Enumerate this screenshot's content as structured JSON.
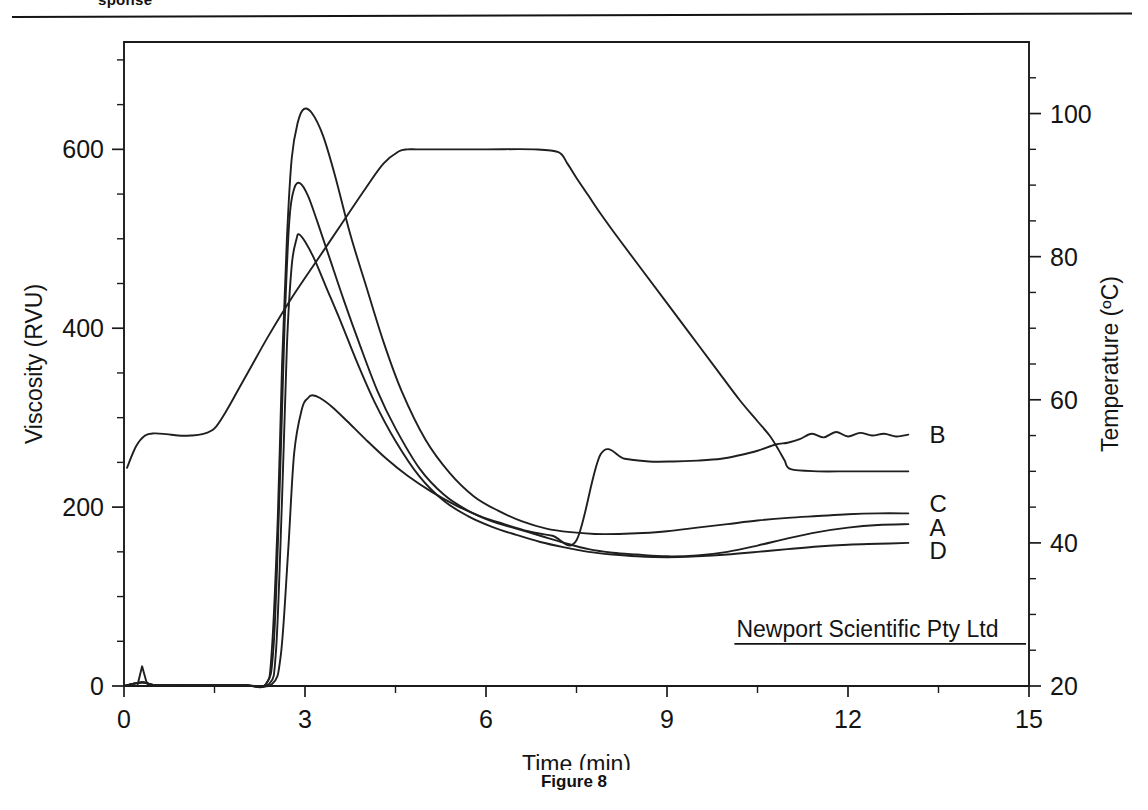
{
  "page": {
    "header_cut_text": "sponse",
    "figure_caption": "Figure 8"
  },
  "watermark": {
    "text": "Newport Scientific Pty Ltd"
  },
  "chart_data": {
    "type": "line",
    "title": "",
    "xlabel": "Time (min)",
    "ylabel": "Viscosity (RVU)",
    "y2label": "Temperature (ºC)",
    "xlim": [
      0,
      15
    ],
    "ylim": [
      0,
      720
    ],
    "y2lim": [
      20,
      110
    ],
    "grid": false,
    "legend_position": "right-inline",
    "xticks": [
      0,
      3,
      6,
      9,
      12,
      15
    ],
    "xticklabels": [
      "0",
      "3",
      "6",
      "9",
      "12",
      "15"
    ],
    "yticks": [
      0,
      200,
      400,
      600
    ],
    "yticklabels": [
      "0",
      "200",
      "400",
      "600"
    ],
    "y2ticks": [
      20,
      40,
      60,
      80,
      100
    ],
    "y2ticklabels": [
      "20",
      "40",
      "60",
      "80",
      "100"
    ],
    "x_minor_step": 1.5,
    "y_minor_step": 50,
    "y2_minor_step": 5,
    "series": [
      {
        "name": "C",
        "label": "C",
        "axis": "left",
        "units": "RVU",
        "peak_time": 2.98,
        "peak_value": 645,
        "final_value": 193,
        "x": [
          0.0,
          0.3,
          0.5,
          1.0,
          1.5,
          2.0,
          2.35,
          2.45,
          2.55,
          2.62,
          2.7,
          2.78,
          2.88,
          2.98,
          3.12,
          3.3,
          3.5,
          3.75,
          4.0,
          4.3,
          4.6,
          5.0,
          5.4,
          5.8,
          6.2,
          6.6,
          7.0,
          7.4,
          7.8,
          8.2,
          8.6,
          9.0,
          9.5,
          10.0,
          10.5,
          11.0,
          11.5,
          12.0,
          12.5,
          13.0
        ],
        "y": [
          0,
          4,
          1,
          1,
          1,
          1,
          2,
          40,
          190,
          360,
          500,
          590,
          630,
          645,
          640,
          615,
          570,
          505,
          450,
          385,
          330,
          275,
          238,
          212,
          196,
          184,
          176,
          172,
          170,
          170,
          171,
          173,
          177,
          181,
          185,
          188,
          190,
          192,
          193,
          193
        ]
      },
      {
        "name": "A",
        "label": "A",
        "axis": "left",
        "units": "RVU",
        "peak_time": 2.92,
        "peak_value": 562,
        "final_value": 180,
        "x": [
          0.0,
          0.3,
          0.5,
          1.0,
          1.5,
          2.0,
          2.35,
          2.48,
          2.58,
          2.66,
          2.74,
          2.82,
          2.92,
          3.05,
          3.2,
          3.4,
          3.65,
          3.9,
          4.2,
          4.5,
          4.9,
          5.3,
          5.7,
          6.1,
          6.5,
          6.9,
          7.3,
          7.7,
          8.1,
          8.5,
          9.0,
          9.5,
          10.0,
          10.5,
          11.0,
          11.5,
          12.0,
          12.5,
          13.0
        ],
        "y": [
          0,
          4,
          1,
          1,
          1,
          1,
          2,
          45,
          220,
          400,
          520,
          556,
          562,
          548,
          520,
          480,
          430,
          383,
          330,
          288,
          243,
          214,
          196,
          184,
          176,
          168,
          160,
          153,
          149,
          147,
          145,
          146,
          150,
          157,
          165,
          172,
          177,
          180,
          181
        ]
      },
      {
        "name": "D",
        "label": "D",
        "axis": "left",
        "units": "RVU",
        "peak_time": 2.9,
        "peak_value": 505,
        "final_value": 160,
        "x": [
          0.0,
          0.3,
          0.5,
          1.0,
          1.5,
          2.0,
          2.4,
          2.52,
          2.62,
          2.7,
          2.78,
          2.86,
          2.9,
          3.0,
          3.15,
          3.35,
          3.6,
          3.85,
          4.15,
          4.5,
          4.9,
          5.3,
          5.7,
          6.1,
          6.5,
          6.9,
          7.3,
          7.7,
          8.1,
          8.5,
          9.0,
          9.5,
          10.0,
          10.5,
          11.0,
          11.5,
          12.0,
          12.5,
          13.0
        ],
        "y": [
          0,
          4,
          1,
          1,
          1,
          1,
          2,
          40,
          210,
          380,
          470,
          500,
          505,
          497,
          478,
          446,
          406,
          364,
          318,
          274,
          234,
          207,
          190,
          178,
          169,
          161,
          155,
          150,
          147,
          145,
          144,
          145,
          147,
          150,
          153,
          156,
          158,
          159,
          160
        ]
      },
      {
        "name": "B",
        "label": "B",
        "axis": "left",
        "units": "RVU",
        "peak_time": 3.12,
        "peak_value": 325,
        "final_value": 281,
        "x": [
          0.0,
          0.3,
          0.5,
          1.0,
          1.5,
          2.0,
          2.45,
          2.6,
          2.72,
          2.82,
          2.95,
          3.05,
          3.12,
          3.25,
          3.45,
          3.7,
          4.0,
          4.35,
          4.7,
          5.1,
          5.5,
          5.9,
          6.3,
          6.7,
          7.1,
          7.5,
          7.9,
          8.3,
          8.7,
          9.1,
          9.5,
          9.9,
          10.2,
          10.5,
          10.8,
          11.0,
          11.2,
          11.4,
          11.6,
          11.8,
          12.0,
          12.2,
          12.4,
          12.6,
          12.8,
          13.0
        ],
        "y": [
          0,
          4,
          1,
          1,
          1,
          1,
          2,
          35,
          150,
          260,
          310,
          322,
          325,
          322,
          312,
          296,
          276,
          254,
          235,
          217,
          202,
          190,
          181,
          173,
          168,
          163,
          259,
          254,
          251,
          251,
          252,
          254,
          258,
          263,
          270,
          272,
          276,
          282,
          278,
          284,
          279,
          283,
          280,
          282,
          279,
          281
        ]
      },
      {
        "name": "Temperature",
        "label": "",
        "axis": "right",
        "units": "ºC",
        "hold_value": 95,
        "final_value": 50,
        "x": [
          0.05,
          0.2,
          0.35,
          0.5,
          0.7,
          0.9,
          1.1,
          1.3,
          1.5,
          1.7,
          1.9,
          2.1,
          2.4,
          2.8,
          3.2,
          3.6,
          4.0,
          4.3,
          4.55,
          4.7,
          4.85,
          5.2,
          6.0,
          6.8,
          7.2,
          7.35,
          7.5,
          7.7,
          7.9,
          8.2,
          8.6,
          9.0,
          9.4,
          9.8,
          10.2,
          10.5,
          10.7,
          10.85,
          10.95,
          11.05,
          11.5,
          12.0,
          12.5,
          13.0
        ],
        "y": [
          50.5,
          53.5,
          55.0,
          55.3,
          55.2,
          55.0,
          55.0,
          55.2,
          56.0,
          58.5,
          61.5,
          64.5,
          69.0,
          74.5,
          79.5,
          84.5,
          89.5,
          93.0,
          94.7,
          95.0,
          95.0,
          95.0,
          95.0,
          95.0,
          94.6,
          93.0,
          91.0,
          88.5,
          86.0,
          82.5,
          78.0,
          73.5,
          69.0,
          64.5,
          60.0,
          57.0,
          55.0,
          53.0,
          51.5,
          50.3,
          50.0,
          50.0,
          50.0,
          50.0
        ]
      }
    ],
    "annotations": [
      {
        "text": "B",
        "x": 13.35,
        "y_rvu": 282
      },
      {
        "text": "C",
        "x": 13.35,
        "y_rvu": 205
      },
      {
        "text": "A",
        "x": 13.35,
        "y_rvu": 178
      },
      {
        "text": "D",
        "x": 13.35,
        "y_rvu": 152
      }
    ]
  }
}
